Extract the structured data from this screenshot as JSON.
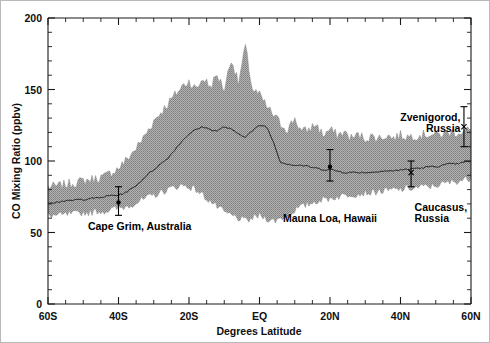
{
  "figure": {
    "background": "#ffffff",
    "border_color": "#b9b9b9",
    "band_color": "#9a9a9a",
    "line_color": "#262626"
  },
  "chart_data": {
    "type": "area",
    "title": "",
    "subtitle": "",
    "xlabel": "Degrees Latitude",
    "ylabel": "CO Mixing Ratio (ppbv)",
    "xlim": [
      -60,
      60
    ],
    "ylim": [
      0,
      200
    ],
    "grid": false,
    "legend_position": "none",
    "y_ticks_major": [
      0,
      50,
      100,
      150,
      200
    ],
    "y_ticks_major_labels": [
      "0",
      "50",
      "100",
      "150",
      "200"
    ],
    "y_tick_minor_step": 10,
    "x_ticks_major": [
      -60,
      -40,
      -20,
      0,
      20,
      40,
      60
    ],
    "x_ticks_major_labels": [
      "60S",
      "40S",
      "20S",
      "EQ",
      "20N",
      "40N",
      "60N"
    ],
    "x_tick_minor_step": 5,
    "x": [
      -60,
      -58,
      -56,
      -54,
      -52,
      -50,
      -48,
      -46,
      -44,
      -42,
      -40,
      -38,
      -36,
      -34,
      -32,
      -30,
      -28,
      -26,
      -24,
      -22,
      -20,
      -18,
      -16,
      -14,
      -12,
      -10,
      -8,
      -6,
      -4,
      -2,
      0,
      2,
      4,
      6,
      8,
      10,
      12,
      14,
      16,
      18,
      20,
      22,
      24,
      26,
      28,
      30,
      32,
      34,
      36,
      38,
      40,
      42,
      44,
      46,
      48,
      50,
      52,
      54,
      56,
      58,
      60
    ],
    "series": [
      {
        "name": "Mean CO mixing ratio",
        "role": "mean-line",
        "values": [
          71,
          71,
          72,
          72,
          73,
          73,
          74,
          74,
          75,
          76,
          76,
          78,
          81,
          85,
          90,
          94,
          98,
          102,
          108,
          114,
          119,
          122,
          124,
          122,
          121,
          124,
          122,
          119,
          117,
          121,
          125,
          124,
          113,
          99,
          98,
          97,
          97,
          96,
          95,
          94,
          94,
          93,
          92,
          92,
          92,
          92,
          92,
          93,
          93,
          93,
          94,
          94,
          95,
          95,
          96,
          96,
          97,
          98,
          98,
          99,
          100
        ]
      },
      {
        "name": "Upper envelope (max)",
        "role": "band-upper",
        "values": [
          82,
          82,
          83,
          84,
          85,
          86,
          87,
          88,
          89,
          92,
          95,
          100,
          106,
          112,
          120,
          128,
          134,
          140,
          146,
          152,
          156,
          150,
          158,
          152,
          160,
          150,
          172,
          154,
          180,
          150,
          146,
          138,
          132,
          126,
          122,
          130,
          120,
          122,
          126,
          118,
          122,
          118,
          120,
          116,
          118,
          116,
          117,
          116,
          118,
          116,
          118,
          117,
          118,
          118,
          119,
          118,
          119,
          120,
          120,
          121,
          122
        ]
      },
      {
        "name": "Lower envelope (min)",
        "role": "band-lower",
        "values": [
          62,
          62,
          62,
          63,
          63,
          64,
          64,
          65,
          65,
          66,
          67,
          68,
          70,
          72,
          74,
          76,
          78,
          80,
          82,
          83,
          82,
          80,
          76,
          72,
          68,
          64,
          62,
          60,
          58,
          60,
          62,
          60,
          58,
          60,
          62,
          66,
          68,
          70,
          72,
          73,
          74,
          75,
          76,
          77,
          77,
          78,
          78,
          79,
          79,
          80,
          80,
          81,
          81,
          82,
          82,
          83,
          84,
          85,
          86,
          87,
          88
        ]
      }
    ],
    "annotations": [
      {
        "id": "cape-grim",
        "label": "Cape Grim, Australia",
        "label_lines": [
          "Cape Grim, Australia"
        ],
        "latitude": -40,
        "value": 71,
        "err_low": 62,
        "err_high": 82,
        "marker": "dot",
        "label_x": -34,
        "label_y": 52,
        "label_anchor": "middle"
      },
      {
        "id": "mauna-loa",
        "label": "Mauna Loa, Hawaii",
        "label_lines": [
          "Mauna Loa, Hawaii"
        ],
        "latitude": 20,
        "value": 96,
        "err_low": 86,
        "err_high": 108,
        "marker": "dot",
        "label_x": 20,
        "label_y": 57,
        "label_anchor": "middle"
      },
      {
        "id": "caucasus-russia",
        "label": "Caucasus, Russia",
        "label_lines": [
          "Caucasus,",
          "Russia"
        ],
        "latitude": 43,
        "value": 92,
        "err_low": 82,
        "err_high": 100,
        "marker": "x",
        "label_x": 44,
        "label_y": 65,
        "label_anchor": "start"
      },
      {
        "id": "zvenigorod-russia",
        "label": "Zvenigorod, Russia",
        "label_lines": [
          "Zvenigorod,",
          "Russia"
        ],
        "latitude": 58,
        "value": 124,
        "err_low": 110,
        "err_high": 138,
        "marker": "x",
        "label_x": 57,
        "label_y": 128,
        "label_anchor": "end"
      }
    ]
  }
}
